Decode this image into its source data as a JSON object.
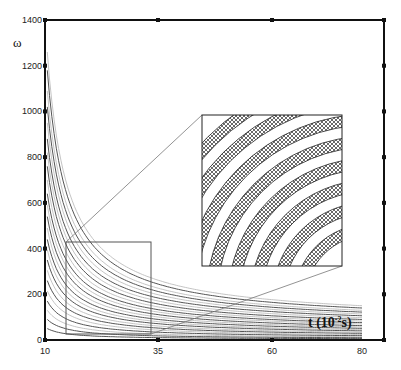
{
  "chart_data": {
    "type": "line",
    "title": "",
    "xlabel": "t (10^-2 s)",
    "xlabel_main": "t (10",
    "xlabel_exp": "-2",
    "xlabel_tail": "s)",
    "ylabel": "ω",
    "xlim": [
      10,
      80
    ],
    "ylim": [
      0,
      1400
    ],
    "x_ticks": [
      10,
      35,
      60,
      80
    ],
    "x_tick_labels": [
      "10",
      "35",
      "60",
      "80"
    ],
    "y_ticks": [
      0,
      200,
      400,
      600,
      800,
      1000,
      1200,
      1400
    ],
    "y_tick_labels": [
      "0",
      "200",
      "400",
      "600",
      "800",
      "1000",
      "1200",
      "1400"
    ],
    "grid": false,
    "legend": "none",
    "series_description": "Family of decaying hyperbolic curves ω(t), alternating dark and light gray",
    "series": [
      {
        "name": "curve-1",
        "start": 1260,
        "end": 150,
        "shade": "light"
      },
      {
        "name": "curve-2",
        "start": 1180,
        "end": 140,
        "shade": "dark"
      },
      {
        "name": "curve-3",
        "start": 1090,
        "end": 130,
        "shade": "light"
      },
      {
        "name": "curve-4",
        "start": 1020,
        "end": 122,
        "shade": "dark"
      },
      {
        "name": "curve-5",
        "start": 950,
        "end": 114,
        "shade": "light"
      },
      {
        "name": "curve-6",
        "start": 880,
        "end": 106,
        "shade": "dark"
      },
      {
        "name": "curve-7",
        "start": 820,
        "end": 98,
        "shade": "light"
      },
      {
        "name": "curve-8",
        "start": 760,
        "end": 90,
        "shade": "dark"
      },
      {
        "name": "curve-9",
        "start": 700,
        "end": 83,
        "shade": "light"
      },
      {
        "name": "curve-10",
        "start": 640,
        "end": 76,
        "shade": "dark"
      },
      {
        "name": "curve-11",
        "start": 590,
        "end": 70,
        "shade": "light"
      },
      {
        "name": "curve-12",
        "start": 540,
        "end": 63,
        "shade": "dark"
      },
      {
        "name": "curve-13",
        "start": 490,
        "end": 57,
        "shade": "light"
      },
      {
        "name": "curve-14",
        "start": 440,
        "end": 51,
        "shade": "dark"
      },
      {
        "name": "curve-15",
        "start": 395,
        "end": 45,
        "shade": "light"
      },
      {
        "name": "curve-16",
        "start": 350,
        "end": 40,
        "shade": "dark"
      },
      {
        "name": "curve-17",
        "start": 305,
        "end": 34,
        "shade": "light"
      },
      {
        "name": "curve-18",
        "start": 260,
        "end": 29,
        "shade": "dark"
      },
      {
        "name": "curve-19",
        "start": 215,
        "end": 24,
        "shade": "light"
      },
      {
        "name": "curve-20",
        "start": 170,
        "end": 19,
        "shade": "dark"
      },
      {
        "name": "curve-21",
        "start": 130,
        "end": 14,
        "shade": "light"
      },
      {
        "name": "curve-22",
        "start": 90,
        "end": 10,
        "shade": "dark"
      },
      {
        "name": "curve-23",
        "start": 50,
        "end": 6,
        "shade": "dark"
      }
    ],
    "zoom_region": {
      "t": [
        15,
        34
      ],
      "omega": [
        15,
        430
      ]
    },
    "inset": {
      "description": "Magnified view of zoom region showing curve bands with cross-hatched fill",
      "bands": 8
    }
  },
  "colors": {
    "axis": "#111111",
    "curve_dark": "#555555",
    "curve_light": "#bdbdbd",
    "zoom_box": "#555555",
    "hatch": "#333333"
  }
}
